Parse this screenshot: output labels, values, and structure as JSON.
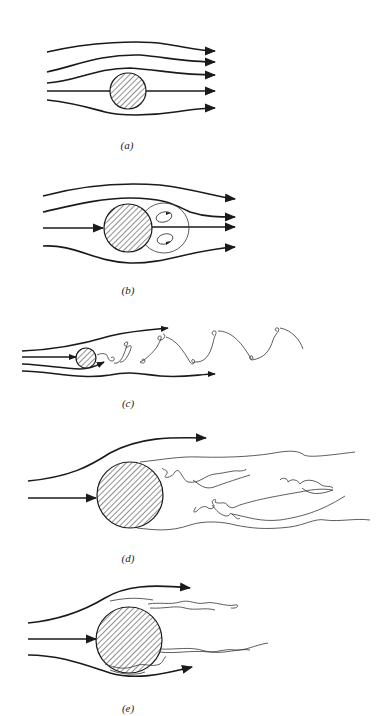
{
  "figure": {
    "panels": [
      {
        "id": "a",
        "label": "(a)",
        "regime": "attached laminar flow"
      },
      {
        "id": "b",
        "label": "(b)",
        "regime": "steady separation with twin recirculating vortices"
      },
      {
        "id": "c",
        "label": "(c)",
        "regime": "periodic vortex street"
      },
      {
        "id": "d",
        "label": "(d)",
        "regime": "laminar boundary layer, wide turbulent wake"
      },
      {
        "id": "e",
        "label": "(e)",
        "regime": "turbulent boundary layer, narrow turbulent wake"
      }
    ],
    "colors": {
      "ink": "#1a1a1a",
      "background": "#ffffff"
    }
  }
}
